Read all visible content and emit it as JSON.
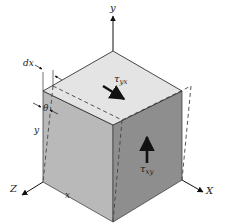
{
  "diagram": {
    "colors": {
      "top_face": "#e4e4e4",
      "left_face": "#b9b9b9",
      "right_face": "#8e8e8e",
      "edge": "#333333",
      "dashed": "#444444",
      "arrow": "#111111",
      "background": "#ffffff"
    },
    "axes": {
      "y_label": "y",
      "x_label": "X",
      "z_label": "Z"
    },
    "dimension_labels": {
      "dx": "dx",
      "theta": "θ",
      "y_height": "y",
      "x_width": "x"
    },
    "stresses": {
      "top": {
        "symbol": "τ",
        "subscript": "yx",
        "direction": "arrow-down-right"
      },
      "side": {
        "symbol": "τ",
        "subscript": "xy",
        "direction": "arrow-up"
      }
    }
  }
}
